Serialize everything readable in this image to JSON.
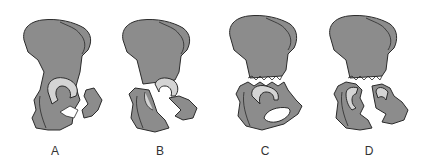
{
  "figure": {
    "type": "anatomical-diagram",
    "colors": {
      "bone": "#8c8c8c",
      "outline": "#2a2a2a",
      "cartilage": "#d4d4d4",
      "background": "#ffffff"
    },
    "panels": [
      {
        "label": "A",
        "description": "posterior wall/column fracture"
      },
      {
        "label": "B",
        "description": "transverse acetabular fracture"
      },
      {
        "label": "C",
        "description": "iliac / supra-acetabular transverse fracture"
      },
      {
        "label": "D",
        "description": "combined T-type / both column fracture"
      }
    ]
  }
}
